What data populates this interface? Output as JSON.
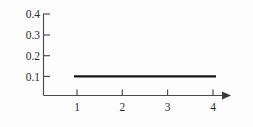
{
  "chart_data": {
    "type": "line",
    "title": "",
    "xlabel": "",
    "ylabel": "",
    "x": [
      1,
      2,
      3,
      4
    ],
    "values": [
      0.1,
      0.1,
      0.1,
      0.1
    ],
    "series": [
      {
        "name": "",
        "x": [
          1,
          4
        ],
        "values": [
          0.1,
          0.1
        ]
      }
    ],
    "xticks": [
      "1",
      "2",
      "3",
      "4"
    ],
    "xtick_values": [
      1,
      2,
      3,
      4
    ],
    "yticks": [
      "0.1",
      "0.2",
      "0.3",
      "0.4"
    ],
    "ytick_values": [
      0.1,
      0.2,
      0.3,
      0.4
    ],
    "xlim": [
      0,
      4.7
    ],
    "ylim": [
      0,
      0.45
    ],
    "grid": false,
    "legend": false,
    "legend_position": "none",
    "line_color": "#141414",
    "axis_color": "#4a4a4a",
    "background_color": "#fdfdfd",
    "x_axis_arrow": true,
    "y_axis_arrow": false,
    "annotations": []
  },
  "axes": {
    "y_labels": {
      "t4": "0.4",
      "t3": "0.3",
      "t2": "0.2",
      "t1": "0.1"
    },
    "x_labels": {
      "t1": "1",
      "t2": "2",
      "t3": "3",
      "t4": "4"
    }
  }
}
